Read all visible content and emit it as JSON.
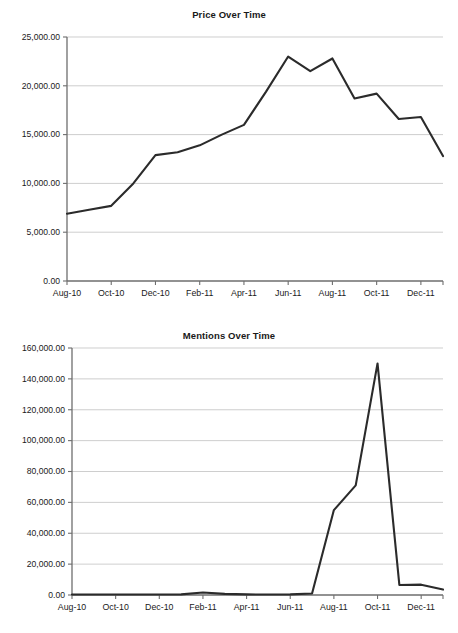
{
  "chart_data": [
    {
      "type": "line",
      "name": "price-over-time",
      "title": "Price Over Time",
      "xlabel": "",
      "ylabel": "",
      "grid": "horizontal",
      "legend": "none",
      "ylim": [
        0,
        25000
      ],
      "ytick_values": [
        0,
        5000,
        10000,
        15000,
        20000,
        25000
      ],
      "ytick_labels": [
        "0.00",
        "5,000.00",
        "10,000.00",
        "15,000.00",
        "20,000.00",
        "25,000.00"
      ],
      "xtick_labels": [
        "Aug-10",
        "Oct-10",
        "Dec-10",
        "Feb-11",
        "Apr-11",
        "Jun-11",
        "Aug-11",
        "Oct-11",
        "Dec-11"
      ],
      "xtick_indices": [
        0,
        2,
        4,
        6,
        8,
        10,
        12,
        14,
        16
      ],
      "x": [
        "Aug-10",
        "Sep-10",
        "Oct-10",
        "Nov-10",
        "Dec-10",
        "Jan-11",
        "Feb-11",
        "Mar-11",
        "Apr-11",
        "May-11",
        "Jun-11",
        "Jul-11",
        "Aug-11",
        "Sep-11",
        "Oct-11",
        "Nov-11",
        "Dec-11",
        "Jan-12"
      ],
      "values": [
        6900,
        7300,
        7700,
        10000,
        12900,
        13200,
        13900,
        15000,
        16000,
        19400,
        23000,
        21500,
        22800,
        18700,
        19200,
        16600,
        16800,
        12800
      ]
    },
    {
      "type": "line",
      "name": "mentions-over-time",
      "title": "Mentions Over Time",
      "xlabel": "",
      "ylabel": "",
      "grid": "horizontal",
      "legend": "none",
      "ylim": [
        0,
        160000
      ],
      "ytick_values": [
        0,
        20000,
        40000,
        60000,
        80000,
        100000,
        120000,
        140000,
        160000
      ],
      "ytick_labels": [
        "0.00",
        "20,000.00",
        "40,000.00",
        "60,000.00",
        "80,000.00",
        "100,000.00",
        "120,000.00",
        "140,000.00",
        "160,000.00"
      ],
      "xtick_labels": [
        "Aug-10",
        "Oct-10",
        "Dec-10",
        "Feb-11",
        "Apr-11",
        "Jun-11",
        "Aug-11",
        "Oct-11",
        "Dec-11"
      ],
      "xtick_indices": [
        0,
        2,
        4,
        6,
        8,
        10,
        12,
        14,
        16
      ],
      "x": [
        "Aug-10",
        "Sep-10",
        "Oct-10",
        "Nov-10",
        "Dec-10",
        "Jan-11",
        "Feb-11",
        "Mar-11",
        "Apr-11",
        "May-11",
        "Jun-11",
        "Jul-11",
        "Aug-11",
        "Sep-11",
        "Oct-11",
        "Nov-11",
        "Dec-11",
        "Jan-12"
      ],
      "values": [
        300,
        300,
        300,
        300,
        300,
        400,
        1600,
        700,
        400,
        300,
        400,
        1000,
        55000,
        71000,
        150000,
        6500,
        6700,
        3500
      ]
    }
  ],
  "colors": {
    "line": "#2b2b2b",
    "gridline": "#b9b9b9",
    "axis": "#6e6e6e",
    "text": "#1a1a1a",
    "background": "#ffffff"
  }
}
